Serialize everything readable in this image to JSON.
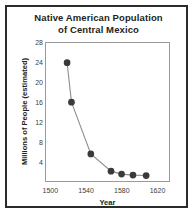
{
  "chart_data": {
    "type": "line",
    "title": "Native American Population of Central Mexico",
    "title_lines": [
      "Native American Population",
      "of Central Mexico"
    ],
    "xlabel": "Year",
    "ylabel": "Millions of People (estimated)",
    "x": [
      1518,
      1523,
      1545,
      1568,
      1580,
      1593,
      1608
    ],
    "values": [
      24.0,
      16.0,
      5.5,
      2.0,
      1.4,
      1.2,
      1.1
    ],
    "points": [
      {
        "x": 1518,
        "y": 24.0
      },
      {
        "x": 1523,
        "y": 16.0
      },
      {
        "x": 1545,
        "y": 5.5
      },
      {
        "x": 1568,
        "y": 2.0
      },
      {
        "x": 1580,
        "y": 1.4
      },
      {
        "x": 1593,
        "y": 1.2
      },
      {
        "x": 1608,
        "y": 1.1
      }
    ],
    "xlim": [
      1494,
      1634
    ],
    "ylim": [
      0,
      28
    ],
    "xticks": [
      1500,
      1540,
      1580,
      1620
    ],
    "yticks": [
      4,
      8,
      12,
      16,
      20,
      24,
      28
    ],
    "grid": false,
    "legend": null,
    "marker_color": "#3a3a3a",
    "line_color": "#8d8d8d",
    "frame_color": "#9a9a9a",
    "border_color": "#2b2b2b"
  }
}
